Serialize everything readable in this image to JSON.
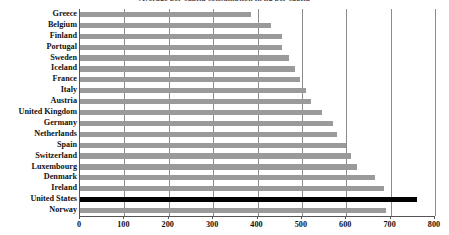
{
  "chart_data": {
    "type": "bar",
    "orientation": "horizontal",
    "title": "Average per-capita consumption in kg per capita",
    "xlabel": "",
    "ylabel": "",
    "xlim": [
      0,
      800
    ],
    "xticks": [
      0,
      100,
      200,
      300,
      400,
      500,
      600,
      700,
      800
    ],
    "xtick_labels": [
      "0",
      "100",
      "200",
      "300",
      "400",
      "500",
      "600",
      "700",
      "800"
    ],
    "grid": true,
    "grid_axis": "x",
    "legend": null,
    "categories": [
      "Greece",
      "Belgium",
      "Finland",
      "Portugal",
      "Sweden",
      "Iceland",
      "France",
      "Italy",
      "Austria",
      "United Kingdom",
      "Germany",
      "Netherlands",
      "Spain",
      "Switzerland",
      "Luxembourg",
      "Denmark",
      "Ireland",
      "United States",
      "Norway"
    ],
    "values": [
      385,
      430,
      455,
      455,
      470,
      485,
      495,
      510,
      520,
      545,
      570,
      580,
      600,
      610,
      625,
      665,
      685,
      760,
      690
    ],
    "colors": {
      "default_bar": "#9a9a9a",
      "highlight_bar": "#000000",
      "gridline": "#8c8c8c",
      "axis": "#555555",
      "background": "#ffffff",
      "text": "#111111"
    },
    "highlight_category": "United States"
  }
}
